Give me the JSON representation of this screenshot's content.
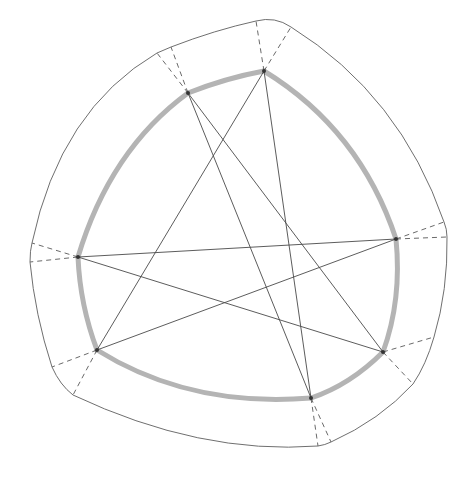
{
  "diagram": {
    "type": "curved heptagon with inscribed heptagram",
    "colors": {
      "background": "#ffffff",
      "outer_boundary": "#6f6f6f",
      "inner_band": "#b4b4b4",
      "chord": "#4a4a4a",
      "dashed": "#6a6a6a",
      "vertex": "#333333"
    },
    "vertices": {
      "A": [
        188,
        93
      ],
      "B": [
        264,
        71
      ],
      "C": [
        396,
        239
      ],
      "D": [
        383,
        352
      ],
      "E": [
        311,
        398
      ],
      "F": [
        97,
        350
      ],
      "G": [
        78,
        257
      ]
    },
    "inner_arcs": [
      "M188,93 Q226,78 264,71",
      "M264,71 Q360,130 396,239",
      "M396,239 Q402,300 383,352",
      "M383,352 Q350,385 311,398",
      "M311,398 Q190,408 97,350",
      "M97,350 Q80,305 78,257",
      "M78,257 Q110,150 188,93"
    ],
    "outer_boundary": "M157,53 Q164,50 171,47 Q215,30 256,21 Q275,16 291,27 Q400,95 444,222 Q447,229 447,237 Q448,290 434,337 Q426,365 413,384 Q380,420 331,442 Q325,445 318,446 Q200,455 73,395 Q60,385 52,367 Q35,315 30,262 Q30,250 32,243 Q60,110 157,53",
    "chords": [
      [
        "A",
        "E"
      ],
      [
        "A",
        "D"
      ],
      [
        "B",
        "F"
      ],
      [
        "B",
        "E"
      ],
      [
        "G",
        "C"
      ],
      [
        "G",
        "D"
      ],
      [
        "F",
        "C"
      ]
    ],
    "dashed_rays": [
      {
        "from": "A",
        "to": [
          157,
          53
        ]
      },
      {
        "from": "A",
        "to": [
          171,
          47
        ]
      },
      {
        "from": "B",
        "to": [
          256,
          21
        ]
      },
      {
        "from": "B",
        "to": [
          291,
          27
        ]
      },
      {
        "from": "C",
        "to": [
          444,
          222
        ]
      },
      {
        "from": "C",
        "to": [
          447,
          237
        ]
      },
      {
        "from": "D",
        "to": [
          434,
          337
        ]
      },
      {
        "from": "D",
        "to": [
          413,
          384
        ]
      },
      {
        "from": "E",
        "to": [
          318,
          446
        ]
      },
      {
        "from": "E",
        "to": [
          331,
          442
        ]
      },
      {
        "from": "F",
        "to": [
          52,
          367
        ]
      },
      {
        "from": "F",
        "to": [
          73,
          395
        ]
      },
      {
        "from": "G",
        "to": [
          32,
          243
        ]
      },
      {
        "from": "G",
        "to": [
          30,
          262
        ]
      }
    ]
  }
}
